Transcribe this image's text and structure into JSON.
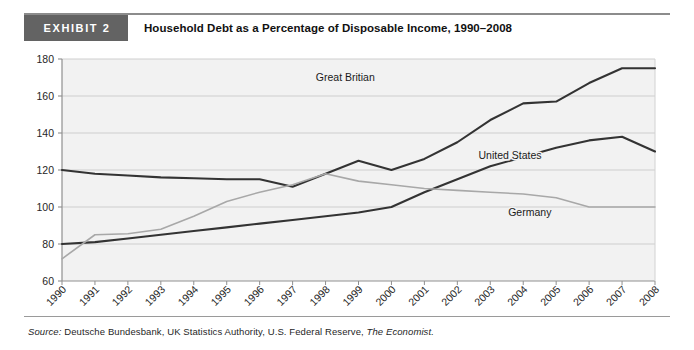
{
  "exhibit": {
    "tag": "EXHIBIT 2",
    "title": "Household Debt as a Percentage of Disposable Income, 1990–2008"
  },
  "source": {
    "label": "Source:",
    "text": "Deutsche Bundesbank, UK Statistics Authority, U.S. Federal Reserve,",
    "publication": "The Economist."
  },
  "chart_data": {
    "type": "line",
    "title": "Household Debt as a Percentage of Disposable Income, 1990–2008",
    "xlabel": "",
    "ylabel": "",
    "ylim": [
      60,
      180
    ],
    "yticks": [
      60,
      80,
      100,
      120,
      140,
      160,
      180
    ],
    "grid": true,
    "legend": "inline-labels",
    "x": [
      1990,
      1991,
      1992,
      1993,
      1994,
      1995,
      1996,
      1997,
      1998,
      1999,
      2000,
      2001,
      2002,
      2003,
      2004,
      2005,
      2006,
      2007,
      2008
    ],
    "categories": [
      "1990",
      "1991",
      "1992",
      "1993",
      "1994",
      "1995",
      "1996",
      "1997",
      "1998",
      "1999",
      "2000",
      "2001",
      "2002",
      "2003",
      "2004",
      "2005",
      "2006",
      "2007",
      "2008"
    ],
    "series": [
      {
        "name": "Great Britian",
        "color": "#333333",
        "width": 2.1,
        "label_x": 1998.6,
        "label_y": 168,
        "values": [
          120,
          118,
          117,
          116,
          115.5,
          115,
          115,
          111,
          118,
          125,
          120,
          126,
          135,
          147,
          156,
          157,
          167,
          175,
          175
        ]
      },
      {
        "name": "United States",
        "color": "#333333",
        "width": 2.1,
        "label_x": 2003.6,
        "label_y": 126,
        "values": [
          80,
          81,
          83,
          85,
          87,
          89,
          91,
          93,
          95,
          97,
          100,
          108,
          115,
          122,
          127,
          132,
          136,
          138,
          130
        ]
      },
      {
        "name": "Germany",
        "color": "#a8a8a8",
        "width": 1.6,
        "label_x": 2004.2,
        "label_y": 95,
        "values": [
          72,
          85,
          85.5,
          88,
          95,
          103,
          108,
          112,
          118,
          114,
          112,
          110,
          109,
          108,
          107,
          105,
          100,
          100,
          100
        ]
      }
    ]
  },
  "axis": {
    "y_tick_labels": [
      "180",
      "160",
      "140",
      "120",
      "100",
      "80",
      "60"
    ],
    "x_tick_labels": [
      "1990",
      "1991",
      "1992",
      "1993",
      "1994",
      "1995",
      "1996",
      "1997",
      "1998",
      "1999",
      "2000",
      "2001",
      "2002",
      "2003",
      "2004",
      "2005",
      "2006",
      "2007",
      "2008"
    ]
  },
  "colors": {
    "plot_background": "#f2f2f2",
    "gridline": "#c9c9c9",
    "axis": "#8f8f8f",
    "tag_background": "#636363",
    "dark_series": "#333333",
    "light_series": "#a8a8a8"
  }
}
